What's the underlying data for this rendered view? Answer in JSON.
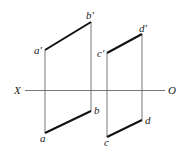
{
  "diagram": {
    "axis": {
      "left_label": "X",
      "right_label": "O"
    },
    "points": {
      "a_prime": "a′",
      "b_prime": "b′",
      "c_prime": "c′",
      "d_prime": "d′",
      "a": "a",
      "b": "b",
      "c": "c",
      "d": "d"
    },
    "colors": {
      "line": "#222222",
      "thin": "#555555"
    }
  }
}
